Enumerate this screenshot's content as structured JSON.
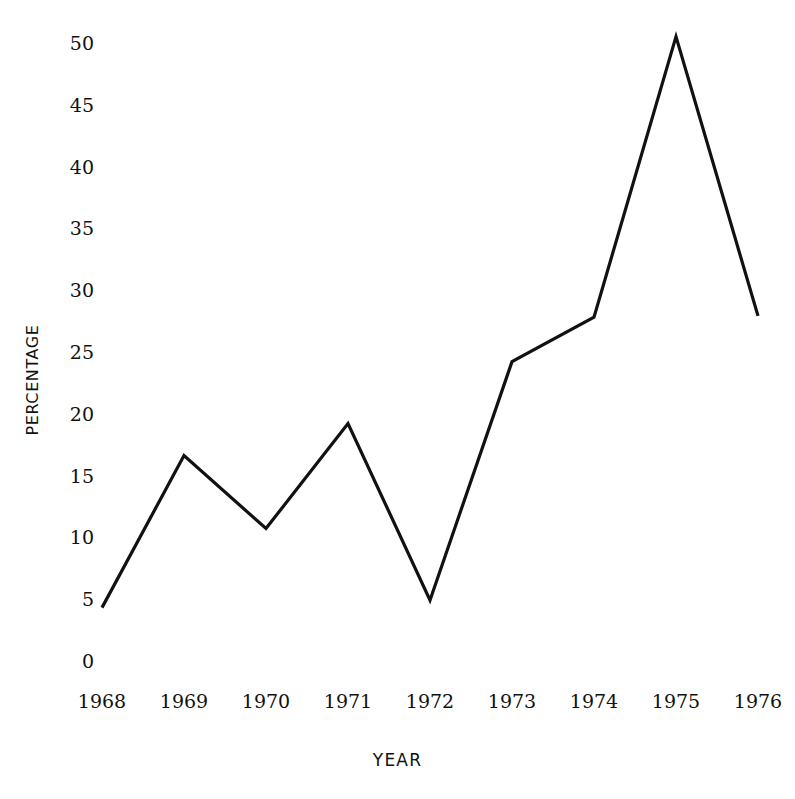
{
  "chart_data": {
    "type": "line",
    "title": "",
    "subtitle": "",
    "xlabel": "YEAR",
    "ylabel": "PERCENTAGE",
    "categories": [
      "1968",
      "1969",
      "1970",
      "1971",
      "1972",
      "1973",
      "1974",
      "1975",
      "1976"
    ],
    "x": [
      1968,
      1969,
      1970,
      1971,
      1972,
      1973,
      1974,
      1975,
      1976
    ],
    "values": [
      4.4,
      16.7,
      10.8,
      19.3,
      5.0,
      24.3,
      27.9,
      50.6,
      28.0
    ],
    "series": [
      {
        "name": "Percentage",
        "values": [
          4.4,
          16.7,
          10.8,
          19.3,
          5.0,
          24.3,
          27.9,
          50.6,
          28.0
        ]
      }
    ],
    "ylim": [
      0,
      50
    ],
    "xlim": [
      1968,
      1976
    ],
    "ytick_labels": [
      "0",
      "5",
      "10",
      "15",
      "20",
      "25",
      "30",
      "35",
      "40",
      "45",
      "50"
    ],
    "ytick_values": [
      0,
      5,
      10,
      15,
      20,
      25,
      30,
      35,
      40,
      45,
      50
    ],
    "xtick_labels": [
      "1968",
      "1969",
      "1970",
      "1971",
      "1972",
      "1973",
      "1974",
      "1975",
      "1976"
    ],
    "grid": false,
    "legend": false,
    "legend_position": "none",
    "markers": false,
    "line_color": "#111111",
    "background_color": "#ffffff",
    "annotations": []
  },
  "axes": {
    "y": {
      "title": "PERCENTAGE",
      "ticks": [
        {
          "label": "50",
          "value": 50
        },
        {
          "label": "45",
          "value": 45
        },
        {
          "label": "40",
          "value": 40
        },
        {
          "label": "35",
          "value": 35
        },
        {
          "label": "30",
          "value": 30
        },
        {
          "label": "25",
          "value": 25
        },
        {
          "label": "20",
          "value": 20
        },
        {
          "label": "15",
          "value": 15
        },
        {
          "label": "10",
          "value": 10
        },
        {
          "label": "5",
          "value": 5
        },
        {
          "label": "0",
          "value": 0
        }
      ]
    },
    "x": {
      "title": "YEAR",
      "ticks": [
        {
          "label": "1968",
          "value": 1968
        },
        {
          "label": "1969",
          "value": 1969
        },
        {
          "label": "1970",
          "value": 1970
        },
        {
          "label": "1971",
          "value": 1971
        },
        {
          "label": "1972",
          "value": 1972
        },
        {
          "label": "1973",
          "value": 1973
        },
        {
          "label": "1974",
          "value": 1974
        },
        {
          "label": "1975",
          "value": 1975
        },
        {
          "label": "1976",
          "value": 1976
        }
      ]
    }
  },
  "geometry": {
    "y_pixel_zero": 662,
    "y_pixel_per_unit": 12.36,
    "x_pixel_first": 102,
    "x_pixel_step": 82
  }
}
